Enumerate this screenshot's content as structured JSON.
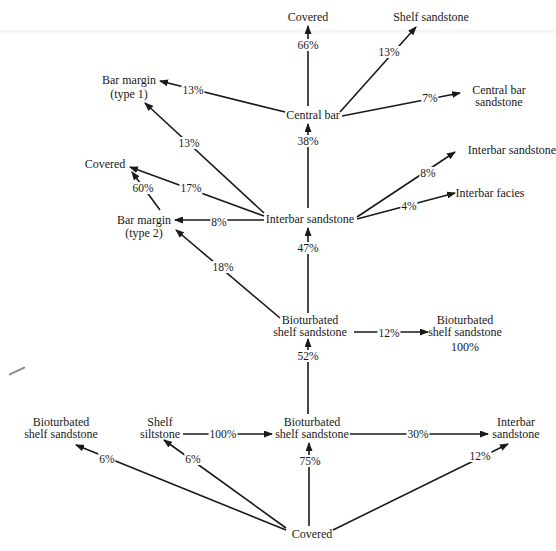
{
  "diagram": {
    "nodes": {
      "covered_top": "Covered",
      "shelf_sandstone": "Shelf sandstone",
      "central_bar": "Central bar",
      "central_bar_sandstone_l1": "Central bar",
      "central_bar_sandstone_l2": "sandstone",
      "bar_margin_1_l1": "Bar margin",
      "bar_margin_1_l2": "(type 1)",
      "covered_left": "Covered",
      "bar_margin_2_l1": "Bar margin",
      "bar_margin_2_l2": "(type 2)",
      "interbar_sandstone_center": "Interbar sandstone",
      "interbar_sandstone_right": "Interbar sandstone",
      "interbar_facies": "Interbar facies",
      "bioturbated_mid_l1": "Bioturbated",
      "bioturbated_mid_l2": "shelf sandstone",
      "bioturbated_right_l1": "Bioturbated",
      "bioturbated_right_l2": "shelf sandstone",
      "bioturbated_right_pct": "100%",
      "bioturbated_left_l1": "Bioturbated",
      "bioturbated_left_l2": "shelf sandstone",
      "shelf_siltstone_l1": "Shelf",
      "shelf_siltstone_l2": "siltstone",
      "bioturbated_bottom_l1": "Bioturbated",
      "bioturbated_bottom_l2": "shelf sandstone",
      "interbar_bottom_l1": "Interbar",
      "interbar_bottom_l2": "sandstone",
      "covered_bottom": "Covered"
    },
    "edges": [
      {
        "id": "central_bar_to_covered",
        "from": "Central bar",
        "to": "Covered",
        "label": "66%"
      },
      {
        "id": "central_bar_to_shelf_sandstone",
        "from": "Central bar",
        "to": "Shelf sandstone",
        "label": "13%"
      },
      {
        "id": "central_bar_to_central_bar_sandstone",
        "from": "Central bar",
        "to": "Central bar sandstone",
        "label": "7%"
      },
      {
        "id": "central_bar_to_bar_margin_1",
        "from": "Central bar",
        "to": "Bar margin (type 1)",
        "label": "13%"
      },
      {
        "id": "interbar_to_central_bar",
        "from": "Interbar sandstone",
        "to": "Central bar",
        "label": "38%"
      },
      {
        "id": "interbar_to_bar_margin_1",
        "from": "Interbar sandstone",
        "to": "Bar margin (type 1)",
        "label": "13%"
      },
      {
        "id": "interbar_to_covered_left",
        "from": "Interbar sandstone",
        "to": "Covered",
        "label": "17%"
      },
      {
        "id": "bar_margin_2_to_covered_left",
        "from": "Bar margin (type 2)",
        "to": "Covered",
        "label": "60%"
      },
      {
        "id": "interbar_to_bar_margin_2",
        "from": "Interbar sandstone",
        "to": "Bar margin (type 2)",
        "label": "8%"
      },
      {
        "id": "interbar_to_interbar_sandstone",
        "from": "Interbar sandstone",
        "to": "Interbar sandstone",
        "label": "8%"
      },
      {
        "id": "interbar_to_interbar_facies",
        "from": "Interbar sandstone",
        "to": "Interbar facies",
        "label": "4%"
      },
      {
        "id": "bioturbated_mid_to_interbar",
        "from": "Bioturbated shelf sandstone",
        "to": "Interbar sandstone",
        "label": "47%"
      },
      {
        "id": "bioturbated_mid_to_bar_margin_2",
        "from": "Bioturbated shelf sandstone",
        "to": "Bar margin (type 2)",
        "label": "18%"
      },
      {
        "id": "bioturbated_mid_to_bioturbated_right",
        "from": "Bioturbated shelf sandstone",
        "to": "Bioturbated shelf sandstone",
        "label": "12%"
      },
      {
        "id": "bioturbated_bottom_to_mid",
        "from": "Bioturbated shelf sandstone",
        "to": "Bioturbated shelf sandstone",
        "label": "52%"
      },
      {
        "id": "shelf_siltstone_to_bioturbated_bottom",
        "from": "Shelf siltstone",
        "to": "Bioturbated shelf sandstone",
        "label": "100%"
      },
      {
        "id": "bioturbated_bottom_to_interbar_bottom",
        "from": "Bioturbated shelf sandstone",
        "to": "Interbar sandstone",
        "label": "30%"
      },
      {
        "id": "covered_to_bioturbated_left",
        "from": "Covered",
        "to": "Bioturbated shelf sandstone",
        "label": "6%"
      },
      {
        "id": "covered_to_shelf_siltstone",
        "from": "Covered",
        "to": "Shelf siltstone",
        "label": "6%"
      },
      {
        "id": "covered_to_bioturbated_bottom",
        "from": "Covered",
        "to": "Bioturbated shelf sandstone",
        "label": "75%"
      },
      {
        "id": "covered_to_interbar_bottom",
        "from": "Covered",
        "to": "Interbar sandstone",
        "label": "12%"
      }
    ],
    "colors": {
      "line": "#1a1a1a",
      "background": "#ffffff"
    }
  }
}
